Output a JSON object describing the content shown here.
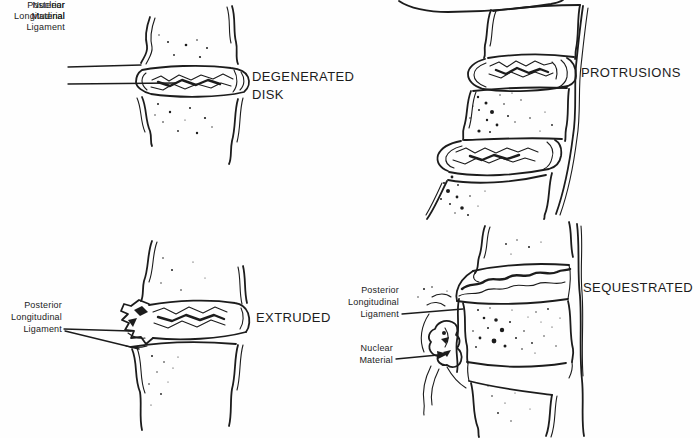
{
  "colors": {
    "ink": "#1c1c1c",
    "paper": "#fefefe"
  },
  "panels": [
    {
      "name": "degenerated-disk",
      "title_line1": "DEGENERATED",
      "title_line2": "DISK",
      "labels": {
        "pll": [
          "Posterior",
          "Longitudinal",
          "Ligament"
        ],
        "nuclear": [
          "Nuclear",
          "Material"
        ]
      }
    },
    {
      "name": "protrusions",
      "title": "PROTRUSIONS"
    },
    {
      "name": "extruded",
      "title": "EXTRUDED",
      "labels": {
        "pll": [
          "Posterior",
          "Longitudinal",
          "Ligament"
        ]
      }
    },
    {
      "name": "sequestrated",
      "title": "SEQUESTRATED",
      "labels": {
        "pll": [
          "Posterior",
          "Longitudinal",
          "Ligament"
        ],
        "nuclear": [
          "Nuclear",
          "Material"
        ]
      }
    }
  ]
}
